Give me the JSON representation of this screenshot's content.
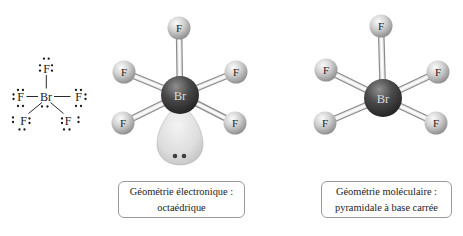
{
  "lewis_structure": {
    "central_atom": "Br",
    "fluorine_labels": [
      "F",
      "F",
      "F",
      "F",
      "F"
    ],
    "central_lone_pair_dot_count": 2,
    "lone_pairs_per_fluorine": 3,
    "ink_color": "#1a1a1a"
  },
  "models": [
    {
      "central_atom": "Br",
      "fluorines": [
        "F",
        "F",
        "F",
        "F",
        "F"
      ],
      "has_lone_pair_lobe": true,
      "lobe_dot_count": 2,
      "caption": {
        "line1": "Géométrie électronique :",
        "line2": "octaédrique"
      }
    },
    {
      "central_atom": "Br",
      "fluorines": [
        "F",
        "F",
        "F",
        "F",
        "F"
      ],
      "has_lone_pair_lobe": false,
      "caption": {
        "line1": "Géométrie moléculaire :",
        "line2": "pyramidale à base carrée"
      }
    }
  ],
  "colors": {
    "background": "#ffffff",
    "bromine_sphere_dark": "#222222",
    "fluorine_sphere_light": "#d2d2d2",
    "bond_outline": "#8a8a8a",
    "bond_fill": "#ebebeb",
    "lone_pair_lobe": "#dedede",
    "caption_border": "#9a9a9a",
    "caption_text": "#1c1c1c"
  }
}
